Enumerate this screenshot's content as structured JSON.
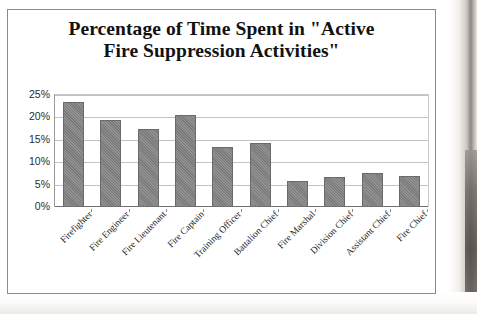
{
  "chart_data": {
    "type": "bar",
    "title": "Percentage of Time Spent in \"Active Fire Suppression Activities\"",
    "title_line1": "Percentage of Time Spent in \"Active",
    "title_line2": "Fire Suppression Activities\"",
    "xlabel": "",
    "ylabel": "",
    "ylim": [
      0,
      25
    ],
    "ytick_labels": [
      "25%",
      "20%",
      "15%",
      "10%",
      "5%",
      "0%"
    ],
    "ytick_values": [
      25,
      20,
      15,
      10,
      5,
      0
    ],
    "grid": true,
    "legend": false,
    "bar_color": "#7a7a7a",
    "categories": [
      "Firefighter",
      "Fire Engineer",
      "Fire Lieutenant",
      "Fire Captain",
      "Training Officer",
      "Battalion Chief",
      "Fire Marshal",
      "Division Chief",
      "Assistant Chief",
      "Fire Chief"
    ],
    "values": [
      23.4,
      19.5,
      17.5,
      20.6,
      13.5,
      14.3,
      5.8,
      6.8,
      7.5,
      7.0
    ],
    "value_labels": [
      "23.4%",
      "19.5%",
      "17.5%",
      "20.6%",
      "13.5%",
      "14.3%",
      "5.8%",
      "6.8%",
      "7.5%",
      "7.0%"
    ]
  }
}
